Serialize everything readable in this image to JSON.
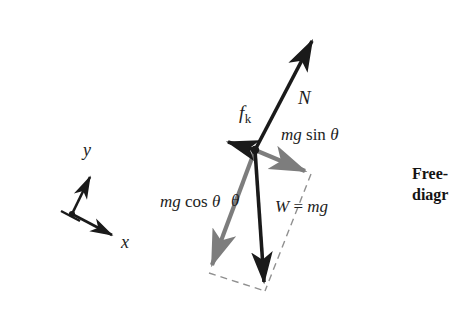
{
  "figure": {
    "background_color": "#ffffff",
    "colors": {
      "vector_primary": "#1a1a1a",
      "vector_component": "#7d7d7d",
      "dashed_construction": "#8a8a8a",
      "axis": "#1a1a1a",
      "text": "#1d1d1d"
    },
    "origin": {
      "x": 255,
      "y": 150
    },
    "vectors": [
      {
        "name": "normal-force",
        "label": "N",
        "style": "solid-black",
        "from": {
          "x": 255,
          "y": 150
        },
        "to": {
          "x": 315,
          "y": 33
        }
      },
      {
        "name": "kinetic-friction-force",
        "label": "f",
        "subscript": "k",
        "style": "solid-black",
        "from": {
          "x": 255,
          "y": 150
        },
        "to": {
          "x": 221,
          "y": 140
        }
      },
      {
        "name": "weight-force",
        "label": "W = mg",
        "style": "solid-black",
        "from": {
          "x": 255,
          "y": 150
        },
        "to": {
          "x": 265,
          "y": 291
        }
      },
      {
        "name": "weight-component-parallel",
        "label": "mg sin θ",
        "style": "solid-gray",
        "from": {
          "x": 255,
          "y": 150
        },
        "to": {
          "x": 311,
          "y": 174
        }
      },
      {
        "name": "weight-component-perpendicular",
        "label": "mg cos θ",
        "style": "solid-gray",
        "from": {
          "x": 255,
          "y": 150
        },
        "to": {
          "x": 209,
          "y": 273
        }
      }
    ],
    "construction_lines": [
      {
        "name": "dashed-parallel-to-mgcos",
        "from": {
          "x": 311,
          "y": 174
        },
        "to": {
          "x": 265,
          "y": 291
        }
      },
      {
        "name": "dashed-parallel-to-mgsin",
        "from": {
          "x": 209,
          "y": 273
        },
        "to": {
          "x": 265,
          "y": 291
        }
      }
    ],
    "angle_marker": {
      "name": "theta-between-W-and-mgcos",
      "symbol": "θ"
    }
  },
  "labels": {
    "normal_force": "N",
    "friction_force_symbol": "f",
    "friction_force_subscript": "k",
    "weight": "W = mg",
    "weight_italic_W": "W",
    "weight_equals": " = ",
    "weight_mg": "mg",
    "component_parallel_mg": "mg",
    "component_parallel_fn": " sin ",
    "component_parallel_theta": "θ",
    "component_perpendicular_mg": "mg",
    "component_perpendicular_fn": " cos ",
    "component_perpendicular_theta": "θ",
    "angle_theta": "θ"
  },
  "axes": {
    "name": "tilted-coordinate-axes",
    "origin": {
      "x": 72,
      "y": 214
    },
    "x_label": "x",
    "y_label": "y",
    "x_tip": {
      "x": 118,
      "y": 238
    },
    "y_tip": {
      "x": 93,
      "y": 169
    }
  },
  "caption": {
    "line1": "Free-",
    "line2": "diagr",
    "full_text_clipped": "Free-body diagram"
  }
}
